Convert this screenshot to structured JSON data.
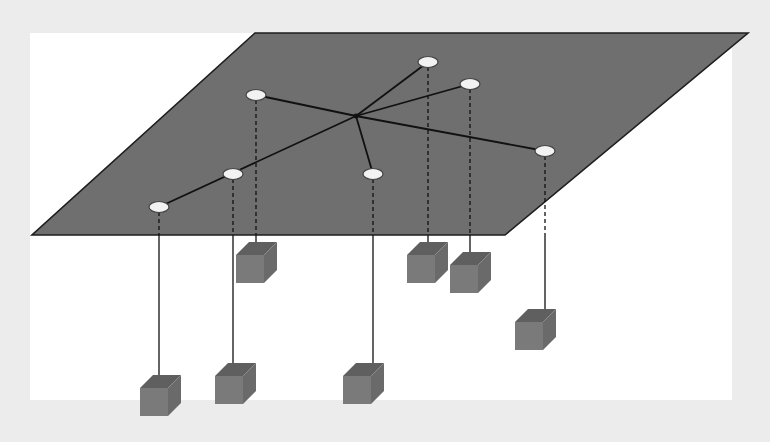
{
  "diagram": {
    "type": "network-topology",
    "colors": {
      "background": "#ececec",
      "panel": "#ffffff",
      "plane_fill": "#6f6f6f",
      "plane_edge": "#1e1e1e",
      "link": "#111111",
      "node_fill": "#f2f2f2",
      "node_stroke": "#444444",
      "box_top": "#5f5f5f",
      "box_front": "#7a7a7a",
      "box_side": "#6a6a6a"
    },
    "plane": {
      "points": "255,33 748,33 505,235 32,235"
    },
    "hub": {
      "x": 356,
      "y": 116
    },
    "nodes": [
      {
        "id": "n1",
        "x": 159,
        "y": 207,
        "box": {
          "x": 140,
          "y": 375
        }
      },
      {
        "id": "n2",
        "x": 233,
        "y": 174,
        "box": {
          "x": 215,
          "y": 363
        }
      },
      {
        "id": "n3",
        "x": 256,
        "y": 95,
        "box": {
          "x": 236,
          "y": 242
        }
      },
      {
        "id": "n4",
        "x": 428,
        "y": 62,
        "box": {
          "x": 407,
          "y": 242
        }
      },
      {
        "id": "n5",
        "x": 470,
        "y": 84,
        "box": {
          "x": 450,
          "y": 252
        }
      },
      {
        "id": "n6",
        "x": 545,
        "y": 151,
        "box": {
          "x": 515,
          "y": 309
        }
      },
      {
        "id": "n7",
        "x": 373,
        "y": 174,
        "box": {
          "x": 343,
          "y": 363
        }
      }
    ],
    "links": [
      {
        "from": "hub",
        "to": "n1"
      },
      {
        "from": "hub",
        "to": "n3"
      },
      {
        "from": "hub",
        "to": "n4"
      },
      {
        "from": "hub",
        "to": "n5"
      },
      {
        "from": "hub",
        "to": "n6"
      },
      {
        "from": "hub",
        "to": "n7"
      }
    ],
    "plane_bottom_y": 235
  }
}
